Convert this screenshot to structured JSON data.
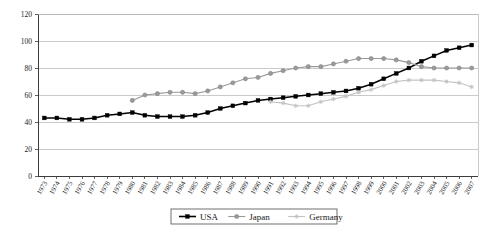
{
  "chart_data": {
    "type": "line",
    "title": "",
    "subtitle": "",
    "xlabel": "",
    "ylabel": "",
    "ylim": [
      0,
      120
    ],
    "yticks": [
      0,
      20,
      40,
      60,
      80,
      100,
      120
    ],
    "grid": true,
    "legend_position": "bottom-center",
    "x": [
      1973,
      1974,
      1975,
      1976,
      1977,
      1978,
      1979,
      1980,
      1981,
      1982,
      1983,
      1984,
      1985,
      1986,
      1987,
      1988,
      1989,
      1990,
      1991,
      1992,
      1993,
      1994,
      1995,
      1996,
      1997,
      1998,
      1999,
      2000,
      2001,
      2002,
      2003,
      2004,
      2005,
      2006,
      2007
    ],
    "categories": [
      "1973",
      "1974",
      "1975",
      "1976",
      "1977",
      "1978",
      "1979",
      "1980",
      "1981",
      "1982",
      "1983",
      "1984",
      "1985",
      "1986",
      "1987",
      "1988",
      "1989",
      "1990",
      "1991",
      "1992",
      "1993",
      "1994",
      "1995",
      "1996",
      "1997",
      "1998",
      "1999",
      "2000",
      "2001",
      "2002",
      "2003",
      "2004",
      "2005",
      "2006",
      "2007"
    ],
    "series": [
      {
        "name": "USA",
        "color": "#000000",
        "marker": "square",
        "values": [
          43,
          43,
          42,
          42,
          43,
          45,
          46,
          47,
          45,
          44,
          44,
          44,
          45,
          47,
          50,
          52,
          54,
          56,
          57,
          58,
          59,
          60,
          61,
          62,
          63,
          65,
          68,
          72,
          76,
          80,
          85,
          89,
          93,
          95,
          97
        ]
      },
      {
        "name": "Japan",
        "color": "#9a9a9a",
        "marker": "circle",
        "values": [
          null,
          null,
          null,
          null,
          null,
          null,
          null,
          56,
          60,
          61,
          62,
          62,
          61,
          63,
          66,
          69,
          72,
          73,
          76,
          78,
          80,
          81,
          81,
          83,
          85,
          87,
          87,
          87,
          86,
          84,
          81,
          80,
          80,
          80,
          80
        ]
      },
      {
        "name": "Germany",
        "color": "#c2c2c2",
        "marker": "star",
        "values": [
          null,
          null,
          null,
          null,
          null,
          null,
          null,
          null,
          null,
          null,
          null,
          null,
          null,
          null,
          null,
          null,
          null,
          null,
          55,
          54,
          52,
          52,
          55,
          57,
          59,
          62,
          64,
          67,
          70,
          71,
          71,
          71,
          70,
          69,
          66
        ]
      }
    ]
  },
  "legend": {
    "items": [
      {
        "label": "USA"
      },
      {
        "label": "Japan"
      },
      {
        "label": "Germany"
      }
    ]
  }
}
